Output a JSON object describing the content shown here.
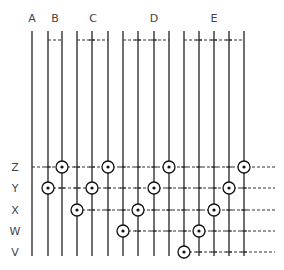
{
  "diagram": {
    "group_labels": [
      {
        "id": "A",
        "label": "A",
        "x": 32
      },
      {
        "id": "B",
        "label": "B",
        "x": 55
      },
      {
        "id": "C",
        "label": "C",
        "x": 93
      },
      {
        "id": "D",
        "label": "D",
        "x": 154
      },
      {
        "id": "E",
        "label": "E",
        "x": 214
      }
    ],
    "groups": [
      {
        "id": "A",
        "lines": [
          32
        ]
      },
      {
        "id": "B",
        "lines": [
          48,
          62
        ]
      },
      {
        "id": "C",
        "lines": [
          77,
          92,
          108
        ]
      },
      {
        "id": "D",
        "lines": [
          123,
          138,
          154,
          169
        ]
      },
      {
        "id": "E",
        "lines": [
          184,
          199,
          214,
          229,
          244
        ]
      }
    ],
    "row_labels": [
      {
        "id": "Z",
        "label": "Z",
        "y": 167
      },
      {
        "id": "Y",
        "label": "Y",
        "y": 188
      },
      {
        "id": "X",
        "label": "X",
        "y": 210
      },
      {
        "id": "W",
        "label": "W",
        "y": 231
      },
      {
        "id": "V",
        "label": "V",
        "y": 252
      }
    ],
    "rows": [
      {
        "id": "Z",
        "y": 167,
        "start_x": 32,
        "circles": [
          62,
          108,
          169,
          244
        ]
      },
      {
        "id": "Y",
        "y": 188,
        "start_x": 48,
        "circles": [
          48,
          92,
          154,
          229
        ]
      },
      {
        "id": "X",
        "y": 210,
        "start_x": 77,
        "circles": [
          77,
          138,
          214
        ]
      },
      {
        "id": "W",
        "y": 231,
        "start_x": 123,
        "circles": [
          123,
          199
        ]
      },
      {
        "id": "V",
        "y": 252,
        "start_x": 184,
        "circles": [
          184
        ]
      }
    ],
    "line_top": 31,
    "line_bottom": 256,
    "top_connector_y": 40,
    "row_end_x": 275
  }
}
